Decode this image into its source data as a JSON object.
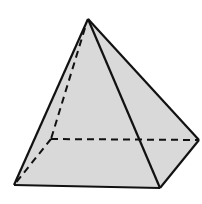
{
  "diagram": {
    "fill_color": "#d9d9d9",
    "stroke_color": "#111111",
    "vertices": {
      "apex": [
        88,
        19
      ],
      "front_left": [
        14,
        185
      ],
      "front_right": [
        160,
        188
      ],
      "right": [
        199,
        140
      ],
      "back_hidden": [
        51,
        139
      ]
    },
    "visible_edges": [
      [
        "apex",
        "front_left"
      ],
      [
        "apex",
        "front_right"
      ],
      [
        "apex",
        "right"
      ],
      [
        "front_left",
        "front_right"
      ],
      [
        "front_right",
        "right"
      ]
    ],
    "hidden_edges": [
      [
        "apex",
        "back_hidden"
      ],
      [
        "back_hidden",
        "front_left"
      ],
      [
        "back_hidden",
        "right"
      ]
    ]
  }
}
